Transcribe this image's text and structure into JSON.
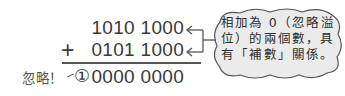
{
  "equation": {
    "operand1": "1010 1000",
    "operator": "+",
    "operand2": "0101 1000",
    "overflow_bit": "①",
    "result": "0000 0000",
    "ignore_label": "忽略！"
  },
  "callout": {
    "lines": [
      "相加為 0（忽略溢",
      "位）的兩個數，具",
      "有「補數」關係。"
    ],
    "full_text": "相加為0（忽略溢位）的兩個數，具有「補數」關係。"
  },
  "colors": {
    "text": "#3a3a3a",
    "callout_fill": "#ebebeb",
    "callout_border": "#555555",
    "rule_line": "#555555"
  }
}
